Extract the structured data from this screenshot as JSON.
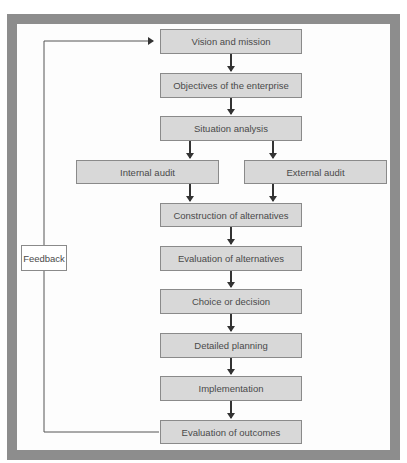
{
  "diagram": {
    "type": "flowchart",
    "colors": {
      "frame": "#8d8d8d",
      "box_fill": "#d8d8d8",
      "box_border": "#8a8a8a",
      "arrow": "#333333",
      "text": "#4a4a4a"
    },
    "nodes": {
      "vision": "Vision and mission",
      "objectives": "Objectives of the enterprise",
      "situation": "Situation analysis",
      "internal_audit": "Internal audit",
      "external_audit": "External audit",
      "construction": "Construction of alternatives",
      "evaluation_alternatives": "Evaluation of alternatives",
      "choice": "Choice or decision",
      "detailed_planning": "Detailed planning",
      "implementation": "Implementation",
      "evaluation_outcomes": "Evaluation of outcomes"
    },
    "feedback_label": "Feedback",
    "edges": [
      [
        "Vision and mission",
        "Objectives of the enterprise"
      ],
      [
        "Objectives of the enterprise",
        "Situation analysis"
      ],
      [
        "Situation analysis",
        "Internal audit"
      ],
      [
        "Situation analysis",
        "External audit"
      ],
      [
        "Internal audit",
        "Construction of alternatives"
      ],
      [
        "External audit",
        "Construction of alternatives"
      ],
      [
        "Construction of alternatives",
        "Evaluation of alternatives"
      ],
      [
        "Evaluation of alternatives",
        "Choice or decision"
      ],
      [
        "Choice or decision",
        "Detailed planning"
      ],
      [
        "Detailed planning",
        "Implementation"
      ],
      [
        "Implementation",
        "Evaluation of outcomes"
      ],
      [
        "Evaluation of outcomes",
        "Vision and mission",
        "Feedback"
      ]
    ]
  }
}
